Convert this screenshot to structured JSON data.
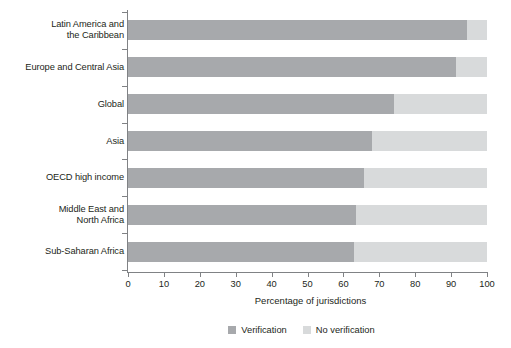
{
  "chart_data": {
    "type": "bar",
    "orientation": "horizontal",
    "stacked": true,
    "title": "",
    "xlabel": "Percentage of jurisdictions",
    "ylabel": "",
    "xlim": [
      0,
      100
    ],
    "xticks": [
      0,
      10,
      20,
      30,
      40,
      50,
      60,
      70,
      80,
      90,
      100
    ],
    "xtick_labels": [
      "0",
      "10",
      "20",
      "30",
      "40",
      "50",
      "60",
      "70",
      "80",
      "90",
      "100"
    ],
    "grid": false,
    "legend_position": "bottom",
    "categories": [
      "Latin America and\nthe Caribbean",
      "Europe and Central Asia",
      "Global",
      "Asia",
      "OECD high income",
      "Middle East and\nNorth Africa",
      "Sub-Saharan Africa"
    ],
    "series": [
      {
        "name": "Verification",
        "color": "#a7a9ac",
        "values": [
          94.4,
          91.4,
          74.1,
          68.0,
          65.7,
          63.5,
          63.0
        ]
      },
      {
        "name": "No verification",
        "color": "#d8dadb",
        "values": [
          5.6,
          8.6,
          25.9,
          32.0,
          34.3,
          36.5,
          37.0
        ]
      }
    ]
  },
  "legend": {
    "items": [
      {
        "label": "Verification",
        "swatch": "verification"
      },
      {
        "label": "No verification",
        "swatch": "noverification"
      }
    ]
  },
  "colors": {
    "verification": "#a7a9ac",
    "no_verification": "#d8dadb",
    "axis": "#808285",
    "text": "#231f20",
    "background": "#ffffff"
  }
}
